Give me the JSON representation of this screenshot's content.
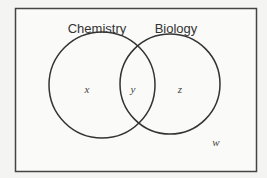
{
  "diagram": {
    "type": "venn",
    "sets": [
      {
        "name": "Chemistry"
      },
      {
        "name": "Biology"
      }
    ],
    "regions": {
      "chemistry_only": "x",
      "both": "y",
      "biology_only": "z",
      "neither": "w"
    },
    "colors": {
      "background": "#f4f4f2",
      "stroke": "#333333",
      "text": "#333333"
    }
  }
}
